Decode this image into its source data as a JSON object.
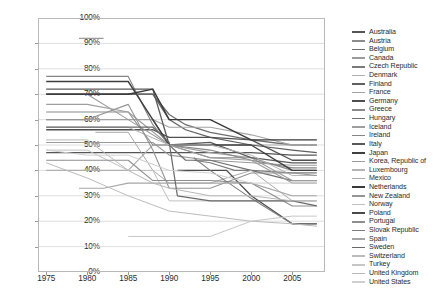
{
  "chart_data": {
    "type": "line",
    "title": "",
    "xlabel": "",
    "ylabel": "",
    "xlim": [
      1974,
      2009
    ],
    "ylim": [
      0,
      100
    ],
    "grid": true,
    "legend_position": "right",
    "y_ticks": [
      "0%",
      "10%",
      "20%",
      "30%",
      "40%",
      "50%",
      "60%",
      "70%",
      "80%",
      "90%",
      "100%"
    ],
    "y_tick_values": [
      0,
      10,
      20,
      30,
      40,
      50,
      60,
      70,
      80,
      90,
      100
    ],
    "x_ticks": [
      "1975",
      "1980",
      "1985",
      "1990",
      "1995",
      "2000",
      "2005"
    ],
    "x_tick_values": [
      1975,
      1980,
      1985,
      1990,
      1995,
      2000,
      2005
    ],
    "series": [
      {
        "name": "Australia",
        "color": "#555555",
        "width": 1.3,
        "x": [
          1975,
          1980,
          1985,
          1988,
          1990,
          1992,
          1995,
          2000,
          2005,
          2008
        ],
        "values": [
          47,
          47,
          47,
          47,
          47,
          47,
          47,
          47,
          46,
          46
        ]
      },
      {
        "name": "Austria",
        "color": "#8c8c8c",
        "width": 1.1,
        "x": [
          1979,
          1980,
          1982
        ],
        "values": [
          92,
          92,
          92
        ]
      },
      {
        "name": "Belgium",
        "color": "#6e6e6e",
        "width": 1.3,
        "x": [
          1975,
          1980,
          1985,
          1988,
          1990,
          1992,
          1995,
          2000,
          2005,
          2008
        ],
        "values": [
          70,
          70,
          70,
          70,
          62,
          58,
          55,
          52,
          50,
          50
        ]
      },
      {
        "name": "Canada",
        "color": "#9a9a9a",
        "width": 1.1,
        "x": [
          1975,
          1980,
          1985,
          1988,
          1990,
          1995,
          2000,
          2005,
          2008
        ],
        "values": [
          51,
          51,
          51,
          51,
          46,
          44,
          43,
          42,
          42
        ]
      },
      {
        "name": "Czech Republic",
        "color": "#7a7a7a",
        "width": 1.2,
        "x": [
          1993,
          1995,
          1998,
          2000,
          2005,
          2008
        ],
        "values": [
          44,
          43,
          40,
          40,
          39,
          39
        ]
      },
      {
        "name": "Denmark",
        "color": "#b0b0b0",
        "width": 1.1,
        "x": [
          1975,
          1980,
          1983,
          1985,
          1988,
          1990,
          1992,
          1995,
          2000,
          2005,
          2008
        ],
        "values": [
          40,
          40,
          40,
          40,
          50,
          50,
          50,
          50,
          50,
          50,
          50
        ]
      },
      {
        "name": "Finland",
        "color": "#606060",
        "width": 1.2,
        "x": [
          1975,
          1980,
          1985,
          1988,
          1990,
          1992,
          1995,
          2000,
          2005,
          2008
        ],
        "values": [
          70,
          70,
          70,
          70,
          60,
          56,
          53,
          50,
          48,
          47
        ]
      },
      {
        "name": "France",
        "color": "#a2a2a2",
        "width": 1.1,
        "x": [
          1975,
          1980,
          1985,
          1988,
          1990,
          1995,
          2000,
          2005,
          2008
        ],
        "values": [
          60,
          60,
          60,
          60,
          57,
          57,
          54,
          50,
          50
        ]
      },
      {
        "name": "Germany",
        "color": "#4f4f4f",
        "width": 1.3,
        "x": [
          1975,
          1980,
          1985,
          1988,
          1990,
          1991,
          1995,
          2000,
          2005,
          2008
        ],
        "values": [
          56,
          56,
          56,
          56,
          53,
          53,
          53,
          52,
          44,
          44
        ]
      },
      {
        "name": "Greece",
        "color": "#8a8a8a",
        "width": 1.1,
        "x": [
          1975,
          1980,
          1982,
          1985,
          1988,
          1990,
          1995,
          2000,
          2005,
          2008
        ],
        "values": [
          63,
          63,
          63,
          63,
          50,
          50,
          45,
          45,
          40,
          40
        ]
      },
      {
        "name": "Hungary",
        "color": "#707070",
        "width": 1.2,
        "x": [
          1988,
          1990,
          1992,
          1995,
          2000,
          2005,
          2008
        ],
        "values": [
          60,
          50,
          44,
          44,
          40,
          36,
          36
        ]
      },
      {
        "name": "Iceland",
        "color": "#9e9e9e",
        "width": 1.1,
        "x": [
          1975,
          1980,
          1985,
          1990,
          1995,
          2000,
          2005,
          2008
        ],
        "values": [
          66,
          66,
          63,
          50,
          47,
          45,
          36,
          36
        ]
      },
      {
        "name": "Ireland",
        "color": "#858585",
        "width": 1.1,
        "x": [
          1975,
          1980,
          1985,
          1988,
          1990,
          1995,
          2000,
          2005,
          2008
        ],
        "values": [
          77,
          77,
          77,
          58,
          50,
          48,
          44,
          41,
          41
        ]
      },
      {
        "name": "Italy",
        "color": "#5a5a5a",
        "width": 1.3,
        "x": [
          1975,
          1980,
          1985,
          1988,
          1990,
          1995,
          2000,
          2005,
          2008
        ],
        "values": [
          72,
          72,
          72,
          72,
          50,
          51,
          45,
          43,
          43
        ]
      },
      {
        "name": "Japan",
        "color": "#3f3f3f",
        "width": 1.4,
        "x": [
          1975,
          1980,
          1985,
          1988,
          1990,
          1995,
          2000,
          2005,
          2008
        ],
        "values": [
          75,
          75,
          75,
          60,
          50,
          50,
          50,
          40,
          40
        ]
      },
      {
        "name": "Korea, Republic of",
        "color": "#9c9c9c",
        "width": 1.1,
        "x": [
          1975,
          1980,
          1985,
          1990,
          1995,
          2000,
          2005,
          2008
        ],
        "values": [
          70,
          70,
          60,
          50,
          45,
          44,
          35,
          35
        ]
      },
      {
        "name": "Luxembourg",
        "color": "#b4b4b4",
        "width": 1.0,
        "x": [
          1975,
          1980,
          1985,
          1990,
          1995,
          2000,
          2005,
          2008
        ],
        "values": [
          57,
          57,
          57,
          50,
          50,
          46,
          38,
          38
        ]
      },
      {
        "name": "Mexico",
        "color": "#aaaaaa",
        "width": 1.0,
        "x": [
          1981,
          1985,
          1988,
          1990,
          1995,
          2000,
          2005,
          2008
        ],
        "values": [
          55,
          55,
          40,
          35,
          35,
          40,
          28,
          28
        ]
      },
      {
        "name": "Netherlands",
        "color": "#3a3a3a",
        "width": 1.4,
        "x": [
          1975,
          1980,
          1985,
          1988,
          1990,
          1992,
          1995,
          2000,
          2005,
          2008
        ],
        "values": [
          70,
          70,
          70,
          72,
          60,
          60,
          60,
          52,
          52,
          52
        ]
      },
      {
        "name": "New Zealand",
        "color": "#959595",
        "width": 1.1,
        "x": [
          1975,
          1980,
          1985,
          1988,
          1990,
          1995,
          2000,
          2005,
          2008
        ],
        "values": [
          60,
          60,
          66,
          48,
          33,
          33,
          39,
          39,
          38
        ]
      },
      {
        "name": "Norway",
        "color": "#c0c0c0",
        "width": 1.0,
        "x": [
          1975,
          1980,
          1985,
          1988,
          1990,
          1995,
          2000,
          2005,
          2008
        ],
        "values": [
          48,
          48,
          40,
          40,
          28,
          28,
          28,
          28,
          28
        ]
      },
      {
        "name": "Poland",
        "color": "#4a4a4a",
        "width": 1.3,
        "x": [
          1991,
          1993,
          1995,
          1997,
          2000,
          2005,
          2008
        ],
        "values": [
          40,
          40,
          40,
          40,
          30,
          19,
          19
        ]
      },
      {
        "name": "Portugal",
        "color": "#8e8e8e",
        "width": 1.1,
        "x": [
          1975,
          1980,
          1985,
          1988,
          1990,
          1995,
          2000,
          2005,
          2008
        ],
        "values": [
          44,
          44,
          44,
          36,
          36,
          36,
          35,
          26,
          26
        ]
      },
      {
        "name": "Slovak Republic",
        "color": "#7e7e7e",
        "width": 1.1,
        "x": [
          1993,
          1995,
          2000,
          2002,
          2005,
          2008
        ],
        "values": [
          45,
          40,
          29,
          25,
          19,
          19
        ]
      },
      {
        "name": "Spain",
        "color": "#a6a6a6",
        "width": 1.1,
        "x": [
          1979,
          1982,
          1985,
          1988,
          1990,
          1995,
          2000,
          2005,
          2008
        ],
        "values": [
          33,
          33,
          35,
          35,
          35,
          35,
          35,
          30,
          30
        ]
      },
      {
        "name": "Sweden",
        "color": "#6a6a6a",
        "width": 1.2,
        "x": [
          1975,
          1980,
          1985,
          1988,
          1990,
          1991,
          1995,
          2000,
          2005,
          2008
        ],
        "values": [
          57,
          57,
          57,
          57,
          51,
          30,
          28,
          28,
          28,
          26
        ]
      },
      {
        "name": "Switzerland",
        "color": "#bcbcbc",
        "width": 1.0,
        "x": [
          1975,
          1980,
          1985,
          1990,
          1995,
          2000,
          2005,
          2008
        ],
        "values": [
          43,
          37,
          30,
          24,
          22,
          20,
          19,
          18
        ]
      },
      {
        "name": "Turkey",
        "color": "#c6c6c6",
        "width": 1.0,
        "x": [
          1985,
          1990,
          1995,
          2000,
          2005,
          2008
        ],
        "values": [
          14,
          14,
          14,
          20,
          22,
          22
        ]
      },
      {
        "name": "United Kingdom",
        "color": "#b8b8b8",
        "width": 1.0,
        "x": [
          1975,
          1980,
          1985,
          1988,
          1990,
          1995,
          2000,
          2005,
          2008
        ],
        "values": [
          52,
          52,
          40,
          35,
          33,
          30,
          30,
          28,
          28
        ]
      },
      {
        "name": "United States",
        "color": "#cfcfcf",
        "width": 1.0,
        "x": [
          1975,
          1980,
          1985,
          1990,
          1995,
          2000,
          2005,
          2008
        ],
        "values": [
          48,
          46,
          46,
          40,
          39,
          35,
          35,
          35
        ]
      }
    ]
  },
  "axis": {
    "grid_color": "#d6d6d6",
    "border_color": "#b9b9b9",
    "tick_color": "#2b2b2b"
  }
}
